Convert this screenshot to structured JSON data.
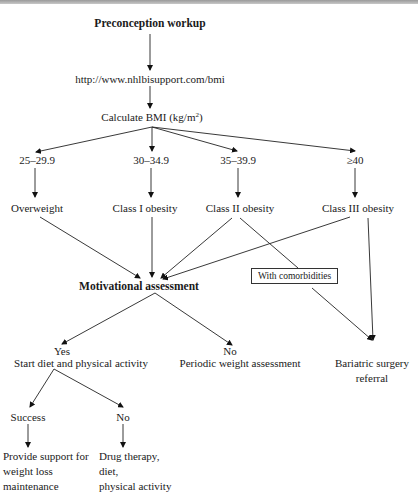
{
  "diagram": {
    "type": "flowchart",
    "nodes": {
      "start": "Preconception workup",
      "url": "http://www.nhlbisupport.com/bmi",
      "calc": "Calculate BMI (kg/m",
      "calc_sup": "2",
      "calc_close": ")",
      "ranges": [
        "25–29.9",
        "30–34.9",
        "35–39.9",
        "≥40"
      ],
      "classes": [
        "Overweight",
        "Class I obesity",
        "Class II obesity",
        "Class III obesity"
      ],
      "motivation": "Motivational assessment",
      "comorbidities": "With comorbidities",
      "yes": "Yes",
      "yes_action": "Start diet and physical activity",
      "no": "No",
      "no_action": "Periodic weight assessment",
      "bariatric": [
        "Bariatric surgery",
        "referral"
      ],
      "success": "Success",
      "fail": "No",
      "success_action": [
        "Provide support for",
        "weight loss",
        "maintenance"
      ],
      "fail_action": [
        "Drug therapy,",
        "diet,",
        "physical activity"
      ]
    },
    "edges": [
      [
        "Preconception workup",
        "http://www.nhlbisupport.com/bmi"
      ],
      [
        "http://www.nhlbisupport.com/bmi",
        "Calculate BMI"
      ],
      [
        "Calculate BMI",
        "25–29.9"
      ],
      [
        "Calculate BMI",
        "30–34.9"
      ],
      [
        "Calculate BMI",
        "35–39.9"
      ],
      [
        "Calculate BMI",
        "≥40"
      ],
      [
        "25–29.9",
        "Overweight"
      ],
      [
        "30–34.9",
        "Class I obesity"
      ],
      [
        "35–39.9",
        "Class II obesity"
      ],
      [
        "≥40",
        "Class III obesity"
      ],
      [
        "Overweight",
        "Motivational assessment"
      ],
      [
        "Class I obesity",
        "Motivational assessment"
      ],
      [
        "Class II obesity",
        "Motivational assessment"
      ],
      [
        "Class III obesity",
        "Motivational assessment"
      ],
      [
        "Class II obesity",
        "With comorbidities"
      ],
      [
        "With comorbidities",
        "Bariatric surgery referral"
      ],
      [
        "Class III obesity",
        "Bariatric surgery referral"
      ],
      [
        "Motivational assessment",
        "Yes"
      ],
      [
        "Motivational assessment",
        "No"
      ],
      [
        "Start diet and physical activity",
        "Success"
      ],
      [
        "Start diet and physical activity",
        "No"
      ],
      [
        "Success",
        "Provide support for weight loss maintenance"
      ],
      [
        "No",
        "Drug therapy, diet, physical activity"
      ]
    ]
  }
}
